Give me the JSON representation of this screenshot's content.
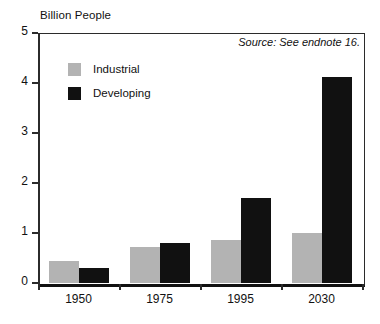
{
  "chart_data": {
    "type": "bar",
    "title": "",
    "ylabel": "Billion People",
    "xlabel": "",
    "categories": [
      "1950",
      "1975",
      "1995",
      "2030"
    ],
    "series": [
      {
        "name": "Industrial",
        "color": "#b3b3b3",
        "values": [
          0.44,
          0.72,
          0.87,
          1.0
        ]
      },
      {
        "name": "Developing",
        "color": "#111111",
        "values": [
          0.3,
          0.8,
          1.7,
          4.13
        ]
      }
    ],
    "ylim": [
      0,
      5
    ],
    "yticks": [
      "0",
      "1",
      "2",
      "3",
      "4",
      "5"
    ],
    "ytick_values": [
      0,
      1,
      2,
      3,
      4,
      5
    ],
    "grid": false,
    "legend_position": "upper-left",
    "annotations": [
      {
        "name": "source-note",
        "text": "Source: See endnote 16."
      }
    ]
  },
  "legend": {
    "items": [
      {
        "label": "Industrial"
      },
      {
        "label": "Developing"
      }
    ]
  },
  "source": {
    "text": "Source: See endnote 16."
  }
}
